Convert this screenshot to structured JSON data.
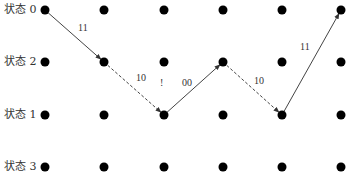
{
  "title": "",
  "states": [
    {
      "label": "状态 0",
      "y": 10
    },
    {
      "label": "状态 2",
      "y": 62
    },
    {
      "label": "状态 1",
      "y": 115
    },
    {
      "label": "状态 3",
      "y": 167
    }
  ],
  "columns_x": [
    45,
    104,
    164,
    223,
    282,
    341
  ],
  "dot_color": "#000000",
  "path": [
    {
      "from": [
        0,
        0
      ],
      "to": [
        1,
        1
      ],
      "label": "11",
      "style": "solid",
      "label_pos": [
        78,
        31
      ]
    },
    {
      "from": [
        1,
        1
      ],
      "to": [
        2,
        2
      ],
      "label": "10",
      "style": "dashed",
      "label_pos": [
        136,
        81
      ]
    },
    {
      "from": [
        2,
        2
      ],
      "to": [
        3,
        1
      ],
      "label": "00",
      "style": "solid",
      "label_pos": [
        182,
        86
      ]
    },
    {
      "from": [
        3,
        1
      ],
      "to": [
        4,
        2
      ],
      "label": "10",
      "style": "dashed",
      "label_pos": [
        254,
        84
      ]
    },
    {
      "from": [
        4,
        2
      ],
      "to": [
        5,
        0
      ],
      "label": "11",
      "style": "solid",
      "label_pos": [
        300,
        50
      ]
    }
  ],
  "marker": {
    "label": "!",
    "pos": [
      160,
      86
    ]
  }
}
